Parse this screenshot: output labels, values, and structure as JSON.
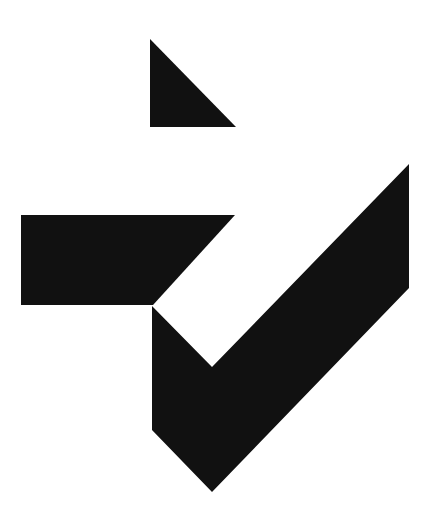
{
  "figure": {
    "background": "#ffffff",
    "fill": "#111111",
    "shapes": [
      {
        "name": "top-triangle",
        "points": "150,39 150,127 236,127"
      },
      {
        "name": "horizontal-parallelogram",
        "points": "21,215 235,215 153,305 21,305"
      },
      {
        "name": "checkmark-body",
        "points": "152,306 212,367 409,164 409,288 212,492 152,430"
      }
    ]
  }
}
